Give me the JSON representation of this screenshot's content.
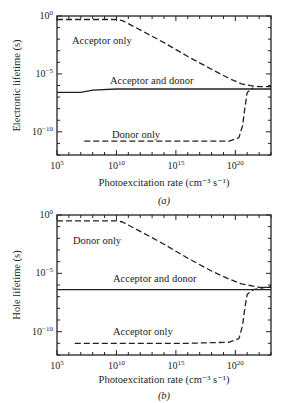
{
  "header": {
    "cropped_caption": ""
  },
  "chart_data": [
    {
      "type": "line",
      "panel_label": "(a)",
      "ylabel": "Electronic lifetime (s)",
      "xlabel": "Photoexcitation rate (cm⁻³ s⁻¹)",
      "xscale": "log",
      "yscale": "log",
      "xlim_exp": [
        5,
        23
      ],
      "ylim_exp": [
        -12,
        0
      ],
      "xticks": [
        "10^5",
        "10^10",
        "10^15",
        "10^20"
      ],
      "yticks": [
        "10^0",
        "10^-5",
        "10^-10"
      ],
      "series": [
        {
          "name": "Acceptor only",
          "style": "dashed",
          "x_exp": [
            5,
            10,
            10.5,
            12,
            14,
            16,
            18,
            19.5,
            20.5,
            21.5,
            22,
            23
          ],
          "y_exp": [
            -0.3,
            -0.3,
            -0.4,
            -1.2,
            -2.3,
            -3.5,
            -4.6,
            -5.4,
            -5.85,
            -6.05,
            -6.1,
            -6.1
          ],
          "label_pos": {
            "x": 72,
            "y": 44
          }
        },
        {
          "name": "Acceptor and donor",
          "style": "solid",
          "x_exp": [
            5,
            7,
            8,
            10,
            15,
            20,
            21,
            23
          ],
          "y_exp": [
            -6.6,
            -6.6,
            -6.4,
            -6.3,
            -6.3,
            -6.3,
            -6.3,
            -6.3
          ],
          "label_pos": {
            "x": 110,
            "y": 84
          }
        },
        {
          "name": "Donor only",
          "style": "dashed",
          "x_exp": [
            7.3,
            12,
            16,
            19.5,
            20.3,
            20.6,
            20.8,
            21.0,
            21.5
          ],
          "y_exp": [
            -10.8,
            -10.8,
            -10.8,
            -10.8,
            -10.5,
            -9.5,
            -8,
            -6.6,
            -6.2
          ],
          "label_pos": {
            "x": 112,
            "y": 138
          }
        }
      ]
    },
    {
      "type": "line",
      "panel_label": "(b)",
      "ylabel": "Hole lifetime (s)",
      "xlabel": "Photoexcitation rate (cm⁻³ s⁻¹)",
      "xscale": "log",
      "yscale": "log",
      "xlim_exp": [
        5,
        23
      ],
      "ylim_exp": [
        -12,
        0
      ],
      "xticks": [
        "10^5",
        "10^10",
        "10^15",
        "10^20"
      ],
      "yticks": [
        "10^0",
        "10^-5",
        "10^-10"
      ],
      "series": [
        {
          "name": "Donor only",
          "style": "dashed",
          "x_exp": [
            5,
            10,
            10.5,
            12,
            14,
            16,
            18,
            19.5,
            20.5,
            21.5,
            22,
            23
          ],
          "y_exp": [
            -0.5,
            -0.5,
            -0.6,
            -1.4,
            -2.5,
            -3.7,
            -4.8,
            -5.5,
            -5.9,
            -6.1,
            -6.2,
            -6.2
          ],
          "label_pos": {
            "x": 73,
            "y": 244
          }
        },
        {
          "name": "Acceptor and donor",
          "style": "solid",
          "x_exp": [
            5,
            23
          ],
          "y_exp": [
            -6.4,
            -6.4
          ],
          "label_pos": {
            "x": 113,
            "y": 282
          }
        },
        {
          "name": "Acceptor only",
          "style": "dashed",
          "x_exp": [
            6.5,
            12,
            16,
            19.5,
            20.3,
            20.6,
            20.8,
            21.0,
            21.5,
            23
          ],
          "y_exp": [
            -11.0,
            -11.0,
            -11.0,
            -10.9,
            -10.6,
            -9.5,
            -8,
            -6.8,
            -6.4,
            -6.1
          ],
          "label_pos": {
            "x": 113,
            "y": 335
          }
        }
      ]
    }
  ],
  "panels": [
    {
      "box": {
        "x": 57,
        "y": 16,
        "w": 214,
        "h": 139
      },
      "ylabel_x": 20,
      "xlabel_y": 186,
      "panel_label_y": 204
    },
    {
      "box": {
        "x": 57,
        "y": 215,
        "w": 214,
        "h": 140
      },
      "ylabel_x": 20,
      "xlabel_y": 383,
      "panel_label_y": 399
    }
  ]
}
